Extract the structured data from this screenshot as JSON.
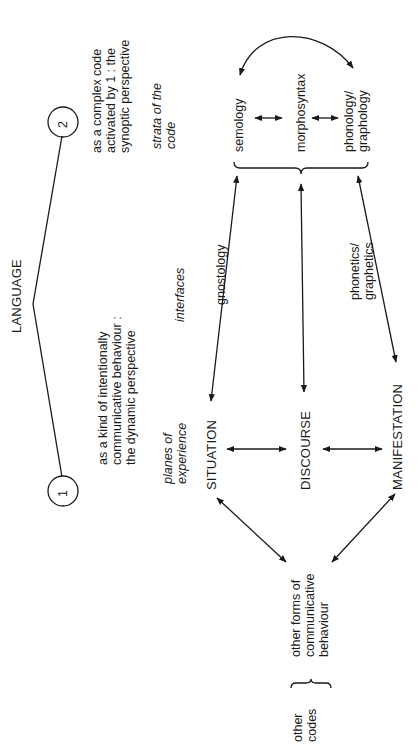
{
  "title": "LANGUAGE",
  "perspectives": {
    "one": {
      "number": "1",
      "text": "as a kind of intentionally\ncommunicative behaviour :\nthe dynamic perspective"
    },
    "two": {
      "number": "2",
      "text": "as a complex code\nactivated by 1 : the\nsynoptic perspective"
    }
  },
  "labels": {
    "planes": "planes of\nexperience",
    "interfaces": "interfaces",
    "strata": "strata of the\ncode"
  },
  "planes": [
    "SITUATION",
    "DISCOURSE",
    "MANIFESTATION"
  ],
  "strata": [
    "semology",
    "morphosyntax",
    "phonology/\ngraphology"
  ],
  "interface_labels": {
    "gnostology": "gnostology",
    "phonetics": "phonetics/\ngraphetics"
  },
  "other": {
    "forms": "other forms of\ncommunicative\nbehaviour",
    "codes": "other\ncodes"
  },
  "colors": {
    "ink": "#1a1a1a",
    "background": "#ffffff"
  }
}
